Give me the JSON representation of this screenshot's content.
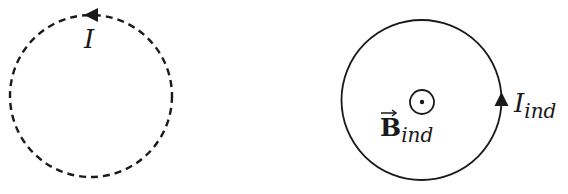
{
  "diagram": {
    "type": "induced-current-loops",
    "left_loop": {
      "style": "dashed",
      "current_label": "I",
      "arrow_direction": "counterclockwise (arrow at top pointing left)",
      "stroke_color": "#1a1a1a"
    },
    "right_loop": {
      "style": "solid",
      "current_label": "I",
      "current_subscript": "ind",
      "arrow_direction": "counterclockwise (arrow at right pointing up)",
      "field_label": "B",
      "field_subscript": "ind",
      "field_vector_arrow": "→",
      "field_symbol": "out-of-page (dot in circle)",
      "stroke_color": "#1a1a1a"
    }
  }
}
